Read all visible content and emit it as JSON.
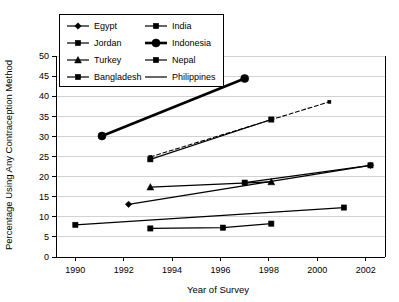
{
  "chart_data": {
    "type": "line",
    "title": "",
    "xlabel": "Year of Survey",
    "ylabel": "Percentage Using Any Contraception Method",
    "xlim": [
      1989.2,
      2002.8
    ],
    "ylim": [
      0,
      50
    ],
    "xticks": [
      1990,
      1992,
      1994,
      1996,
      1998,
      2000,
      2002
    ],
    "xtick_labels": [
      "1990",
      "1992",
      "1994",
      "1996",
      "1998",
      "2000",
      "2002"
    ],
    "yticks": [
      0,
      5,
      10,
      15,
      20,
      25,
      30,
      35,
      40,
      45,
      50
    ],
    "ytick_labels": [
      "0",
      "5",
      "10",
      "15",
      "20",
      "25",
      "30",
      "35",
      "40",
      "45",
      "50"
    ],
    "grid": "horizontal",
    "legend_position": "top-left-inside",
    "series": [
      {
        "name": "Egypt",
        "marker": "diamond",
        "line_style": "solid",
        "line_weight": "normal",
        "x": [
          1992.2,
          2002.2
        ],
        "values": [
          13.1,
          22.8
        ]
      },
      {
        "name": "India",
        "marker": "square",
        "line_style": "solid",
        "line_weight": "normal",
        "x": [
          1990.0,
          2001.1
        ],
        "values": [
          8.0,
          12.3
        ]
      },
      {
        "name": "Jordan",
        "marker": "square",
        "line_style": "solid",
        "line_weight": "normal",
        "x": [
          1997.0,
          2002.2
        ],
        "values": [
          18.5,
          22.8
        ]
      },
      {
        "name": "Indonesia",
        "marker": "circle",
        "line_style": "solid",
        "line_weight": "thick",
        "x": [
          1991.1,
          1997.0
        ],
        "values": [
          30.1,
          44.4
        ]
      },
      {
        "name": "Turkey",
        "marker": "triangle",
        "line_style": "solid",
        "line_weight": "normal",
        "x": [
          1993.1,
          1998.1
        ],
        "values": [
          17.4,
          18.7
        ]
      },
      {
        "name": "Nepal",
        "marker": "square",
        "line_style": "solid",
        "line_weight": "normal",
        "x": [
          1993.1,
          1998.1
        ],
        "values": [
          24.3,
          34.2
        ]
      },
      {
        "name": "Bangladesh",
        "marker": "square",
        "line_style": "solid",
        "line_weight": "normal",
        "x": [
          1993.1,
          1996.1,
          1998.1
        ],
        "values": [
          7.1,
          7.3,
          8.3
        ]
      },
      {
        "name": "Philippines",
        "marker": "none",
        "line_style": "dashed",
        "line_weight": "normal",
        "x": [
          1993.1,
          2000.5
        ],
        "values": [
          24.9,
          38.6
        ]
      }
    ]
  },
  "legend": {
    "entries": [
      {
        "label": "Egypt",
        "marker": "diamond",
        "line_style": "solid",
        "line_weight": "normal"
      },
      {
        "label": "India",
        "marker": "square",
        "line_style": "solid",
        "line_weight": "normal"
      },
      {
        "label": "Jordan",
        "marker": "square",
        "line_style": "solid",
        "line_weight": "normal"
      },
      {
        "label": "Indonesia",
        "marker": "circle",
        "line_style": "solid",
        "line_weight": "thick"
      },
      {
        "label": "Turkey",
        "marker": "triangle",
        "line_style": "solid",
        "line_weight": "normal"
      },
      {
        "label": "Nepal",
        "marker": "square",
        "line_style": "solid",
        "line_weight": "normal"
      },
      {
        "label": "Bangladesh",
        "marker": "square",
        "line_style": "solid",
        "line_weight": "normal"
      },
      {
        "label": "Philippines",
        "marker": "none",
        "line_style": "solid",
        "line_weight": "normal"
      }
    ]
  },
  "colors": {
    "ink": "#000000",
    "grid": "#bfbfbf",
    "background": "#ffffff"
  }
}
